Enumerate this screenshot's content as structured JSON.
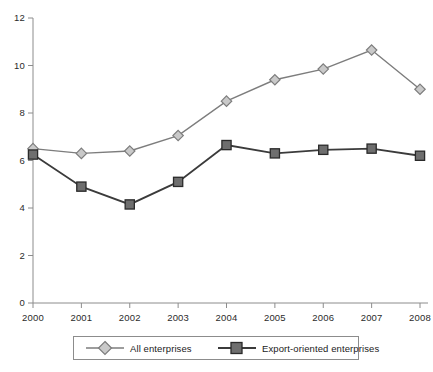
{
  "chart_data": {
    "type": "line",
    "title": "",
    "subtitle": "",
    "xlabel": "",
    "ylabel": "",
    "categories": [
      "2000",
      "2001",
      "2002",
      "2003",
      "2004",
      "2005",
      "2006",
      "2007",
      "2008"
    ],
    "x": [
      2000,
      2001,
      2002,
      2003,
      2004,
      2005,
      2006,
      2007,
      2008
    ],
    "ylim": [
      0,
      12
    ],
    "xlim": [
      2000,
      2008
    ],
    "yticks": [
      "0",
      "2",
      "4",
      "6",
      "8",
      "10",
      "12"
    ],
    "ytick_values": [
      0,
      2,
      4,
      6,
      8,
      10,
      12
    ],
    "grid": false,
    "legend_position": "bottom",
    "series": [
      {
        "name": "All enterprises",
        "marker": "diamond",
        "color": "#7d7d7d",
        "marker_fill": "#c9c9c9",
        "values": [
          6.5,
          6.3,
          6.4,
          7.05,
          8.5,
          9.4,
          9.85,
          10.65,
          9.0
        ]
      },
      {
        "name": "Export-oriented enterprises",
        "marker": "square",
        "color": "#3b3b3b",
        "marker_fill": "#6e6e6e",
        "values": [
          6.25,
          4.9,
          4.15,
          5.1,
          6.65,
          6.3,
          6.45,
          6.5,
          6.2
        ]
      }
    ]
  },
  "axis": {
    "line_color": "#8c8c8c"
  },
  "legend": {
    "entries": [
      {
        "label": "All enterprises"
      },
      {
        "label": "Export-oriented enterprises"
      }
    ]
  }
}
